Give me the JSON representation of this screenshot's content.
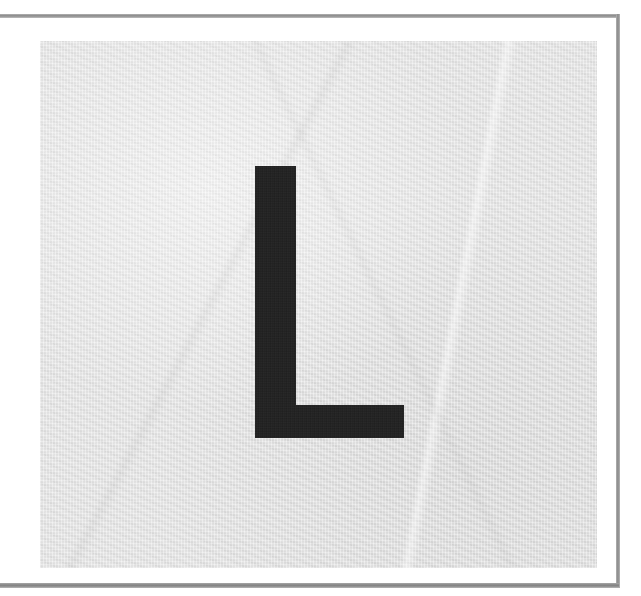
{
  "page": {
    "background_color": "#ffffff",
    "width": 641,
    "height": 596
  },
  "rules": {
    "top": {
      "name": "top-rule",
      "color": "#9a9a9a",
      "thickness_px": 4
    },
    "bottom": {
      "name": "bottom-rule",
      "color": "#909090",
      "thickness_px": 5
    },
    "right": {
      "name": "right-rule",
      "color": "#989898",
      "thickness_px": 4
    }
  },
  "plate": {
    "label": "",
    "background_color": "#e4e4e4",
    "texture": "woven-paper",
    "left_px": 40,
    "top_px": 41,
    "width_px": 557,
    "height_px": 527
  },
  "glyph": {
    "character": "L",
    "name": "letter-l-glyph",
    "ink_color": "#1d1d1d",
    "style": "bold-sans-serif-uppercase",
    "stem_width_px": 41,
    "stem_height_px": 272,
    "foot_width_px": 149,
    "foot_height_px": 33
  }
}
